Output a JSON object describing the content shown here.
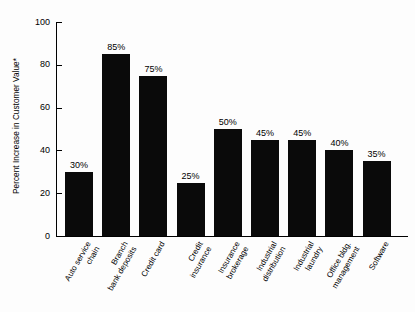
{
  "chart_data": {
    "type": "bar",
    "title": "",
    "xlabel": "",
    "ylabel": "Percent Increase in Customer Value*",
    "ylim": [
      0,
      100
    ],
    "yticks": [
      "0",
      "20",
      "40",
      "60",
      "80",
      "100"
    ],
    "grid": false,
    "legend": "none",
    "bar_color": "#0a0a0a",
    "categories": [
      "Auto service\nchain",
      "Branch\nbank deposits",
      "Credit card",
      "Credit\ninsurance",
      "Insurance\nbrokerage",
      "Industrial\ndistribution",
      "Industrial\nlaundry",
      "Office bldg.\nmanagement",
      "Software"
    ],
    "values": [
      30,
      85,
      75,
      25,
      50,
      45,
      45,
      40,
      35
    ],
    "data_labels": [
      "30%",
      "85%",
      "75%",
      "25%",
      "50%",
      "45%",
      "45%",
      "40%",
      "35%"
    ]
  }
}
